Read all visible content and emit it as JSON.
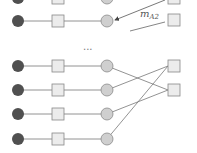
{
  "diagram": {
    "colors": {
      "dark_node": "#505050",
      "square_fill": "#ececec",
      "square_stroke": "#888888",
      "light_node": "#cfcfcf",
      "light_stroke": "#8a8a8a",
      "edge": "#777777"
    },
    "annotation": {
      "label": "m",
      "subscript": "A2"
    },
    "ellipsis": "...",
    "top_rows": [
      {
        "y": -2
      },
      {
        "y": 21
      }
    ],
    "bottom_rows": [
      {
        "y": 66
      },
      {
        "y": 90
      },
      {
        "y": 114
      },
      {
        "y": 139
      }
    ],
    "right_squares_bottom": [
      {
        "y": 66
      },
      {
        "y": 90
      }
    ],
    "right_squares_top": [
      {
        "y": -2
      },
      {
        "y": 20
      }
    ]
  }
}
